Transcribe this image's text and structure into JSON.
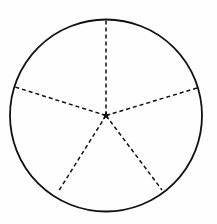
{
  "figure": {
    "name": "circle-divided-into-five-sectors",
    "canvas": {
      "width": 217,
      "height": 224,
      "background": "#fefefe"
    },
    "circle": {
      "center_x": 106,
      "center_y": 115.5,
      "radius": 96,
      "stroke_color": "#111111",
      "stroke_width": 1.8,
      "fill": "none",
      "style": "solid"
    },
    "center_marker": {
      "kind": "star-marker",
      "points": 5,
      "outer_radius": 5.2,
      "inner_radius": 2.0,
      "color": "#111111",
      "x": 106,
      "y": 115.5
    },
    "radii": {
      "count": 5,
      "style": "dashed",
      "stroke_color": "#111111",
      "stroke_width": 1.5,
      "dash_length": 4,
      "dash_gap": 3,
      "segments": [
        {
          "name": "radius-up",
          "angle_deg": 90,
          "end_x": 106,
          "end_y": 19
        },
        {
          "name": "radius-upper-left",
          "angle_deg": 162,
          "end_x": 15,
          "end_y": 87
        },
        {
          "name": "radius-upper-right",
          "angle_deg": 18,
          "end_x": 197,
          "end_y": 88
        },
        {
          "name": "radius-lower-left",
          "angle_deg": 234,
          "end_x": 58,
          "end_y": 192
        },
        {
          "name": "radius-lower-right",
          "angle_deg": 306,
          "end_x": 162,
          "end_y": 190
        }
      ]
    },
    "watermark": {
      "line_one": "",
      "line_two": ""
    }
  },
  "chart_data": {
    "type": "pie",
    "title": "",
    "subtitle": "",
    "xlabel": "",
    "ylabel": "",
    "legend": "none",
    "grid": false,
    "categories": [
      "Sector 1",
      "Sector 2",
      "Sector 3",
      "Sector 4",
      "Sector 5"
    ],
    "values": [
      20,
      20,
      20,
      20,
      20
    ],
    "units": "percent",
    "boundary_angles_deg": [
      90,
      162,
      234,
      306,
      18
    ],
    "slice_angle_deg": 72
  }
}
